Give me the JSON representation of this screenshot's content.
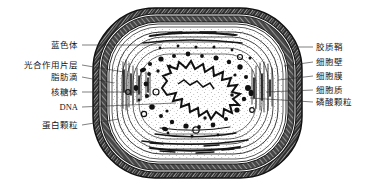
{
  "figure": {
    "background_color": "#ffffff",
    "ink_color": "#161616",
    "style": "hand-drawn pen-and-ink biological diagram"
  },
  "labels_left": [
    {
      "text": "蓝色体",
      "x": 78,
      "y": 47,
      "leader_to_x": 162,
      "leader_to_y": 47
    },
    {
      "text": "光合作用片层",
      "x": 78,
      "y": 67,
      "leader_to_x": 122,
      "leader_to_y": 72
    },
    {
      "text": "脂肪滴",
      "x": 78,
      "y": 79,
      "leader_to_x": 113,
      "leader_to_y": 82
    },
    {
      "text": "核糖体",
      "x": 78,
      "y": 94,
      "leader_to_x": 140,
      "leader_to_y": 92
    },
    {
      "text": "DNA",
      "x": 78,
      "y": 109,
      "leader_to_x": 175,
      "leader_to_y": 104
    },
    {
      "text": "蛋白颗粒",
      "x": 78,
      "y": 127,
      "leader_to_x": 118,
      "leader_to_y": 120
    }
  ],
  "labels_right": [
    {
      "text": "胶质鞘",
      "x": 316,
      "y": 49,
      "leader_from_x": 292,
      "leader_from_y": 49
    },
    {
      "text": "细胞壁",
      "x": 316,
      "y": 64,
      "leader_from_x": 286,
      "leader_from_y": 68
    },
    {
      "text": "细胞膜",
      "x": 316,
      "y": 78,
      "leader_from_x": 280,
      "leader_from_y": 82
    },
    {
      "text": "细胞质",
      "x": 316,
      "y": 92,
      "leader_from_x": 268,
      "leader_from_y": 93
    },
    {
      "text": "磷酸颗粒",
      "x": 316,
      "y": 104,
      "leader_from_x": 252,
      "leader_from_y": 99
    }
  ],
  "structures": {
    "capsule": "胶质鞘",
    "cell_wall": "细胞壁",
    "cell_membrane": "细胞膜",
    "cytoplasm": "细胞质",
    "nucleoid": "DNA",
    "thylakoid": "光合作用片层",
    "ribosome": "核糖体",
    "phycobilisome": "蓝色体",
    "lipid_droplet": "脂肪滴",
    "protein_granule": "蛋白颗粒",
    "phosphate_granule": "磷酸颗粒"
  }
}
